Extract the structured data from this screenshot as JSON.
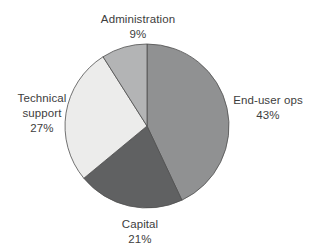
{
  "figure": {
    "background_color": "#ffffff"
  },
  "chart_data": {
    "type": "pie",
    "title": "",
    "slices": [
      {
        "label": "End-user ops",
        "value": 43,
        "pct_label": "43%",
        "color": "#909192"
      },
      {
        "label": "Capital",
        "value": 21,
        "pct_label": "21%",
        "color": "#606162"
      },
      {
        "label": "Technical support",
        "value": 27,
        "pct_label": "27%",
        "color": "#ececeb"
      },
      {
        "label": "Administration",
        "value": 9,
        "pct_label": "9%",
        "color": "#b3b4b5"
      }
    ],
    "start_angle_deg_from_top": 0,
    "direction": "clockwise",
    "outline_color": "#4f4f4f",
    "label_color": "#3d3d3d",
    "legend": "none",
    "labels_position": "outside"
  }
}
